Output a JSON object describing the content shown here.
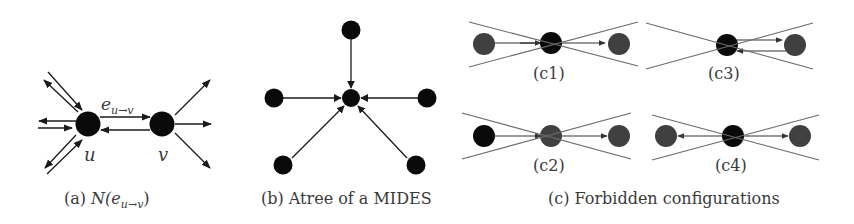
{
  "panels": [
    {
      "id": "a",
      "caption_prefix": "(a) ",
      "caption_N": "N(e",
      "caption_sub": "u→v",
      "caption_suffix": ")",
      "edge_label_e": "e",
      "edge_label_sub": "u→v",
      "node_labels": [
        "u",
        "v"
      ]
    },
    {
      "id": "b",
      "caption": "(b) Atree of a MIDES"
    },
    {
      "id": "c",
      "caption": "(c) Forbidden configurations",
      "subpanels": [
        {
          "id": "c1",
          "label": "(c1)"
        },
        {
          "id": "c2",
          "label": "(c2)"
        },
        {
          "id": "c3",
          "label": "(c3)"
        },
        {
          "id": "c4",
          "label": "(c4)"
        }
      ]
    }
  ],
  "colors": {
    "node_dark": "#0a0a0a",
    "node_gray": "#404040",
    "line": "#1a1a1a",
    "cross_line": "#6a6a6a",
    "text": "#3a3a3a"
  }
}
